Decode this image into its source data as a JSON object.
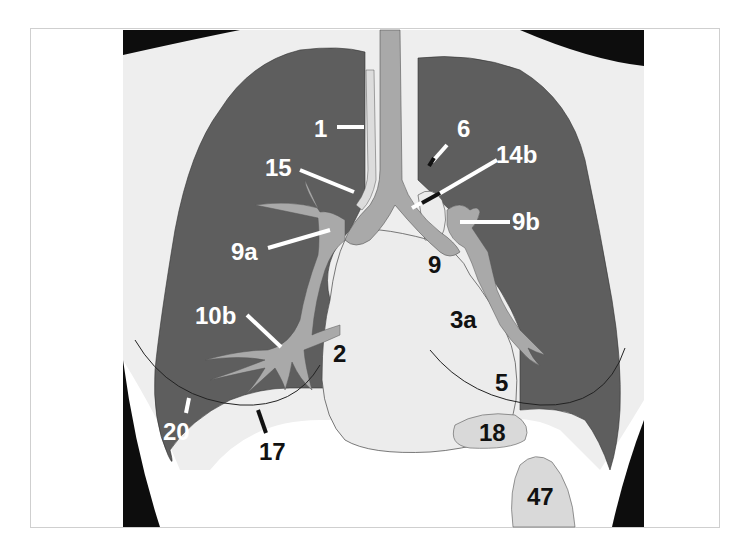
{
  "diagram": {
    "type": "chest-radiograph-schematic (PA view)",
    "colors": {
      "background": "#ffffff",
      "frame_border": "#cfcfcf",
      "thorax_soft_tissue": "#eeeeee",
      "lung_field": "#5e5e5e",
      "trachea_vessels": "#a9a9a9",
      "heart_mediastinum": "#ececec",
      "outer_black": "#0d0d0d",
      "label_white": "#ffffff",
      "label_black": "#111111"
    },
    "labels": [
      {
        "id": "1",
        "text": "1",
        "color": "white",
        "target": "right paratracheal stripe"
      },
      {
        "id": "6",
        "text": "6",
        "color": "white",
        "target": "aortic knob"
      },
      {
        "id": "14b",
        "text": "14b",
        "color": "white",
        "target": "left main bronchus"
      },
      {
        "id": "15",
        "text": "15",
        "color": "white",
        "target": "azygos / right tracheal border"
      },
      {
        "id": "9b",
        "text": "9b",
        "color": "white",
        "target": "left pulmonary artery"
      },
      {
        "id": "9a",
        "text": "9a",
        "color": "white",
        "target": "right pulmonary artery"
      },
      {
        "id": "9",
        "text": "9",
        "color": "black",
        "target": "main pulmonary artery"
      },
      {
        "id": "3a",
        "text": "3a",
        "color": "black",
        "target": "left atrial appendage region"
      },
      {
        "id": "10b",
        "text": "10b",
        "color": "white",
        "target": "right lower lobe vessels"
      },
      {
        "id": "2",
        "text": "2",
        "color": "black",
        "target": "right atrium"
      },
      {
        "id": "5",
        "text": "5",
        "color": "black",
        "target": "left ventricle"
      },
      {
        "id": "20",
        "text": "20",
        "color": "white",
        "target": "breast shadow"
      },
      {
        "id": "17",
        "text": "17",
        "color": "black",
        "target": "right hemidiaphragm"
      },
      {
        "id": "18",
        "text": "18",
        "color": "black",
        "target": "gastric bubble region"
      },
      {
        "id": "47",
        "text": "47",
        "color": "black",
        "target": "stomach / fundus"
      }
    ]
  }
}
